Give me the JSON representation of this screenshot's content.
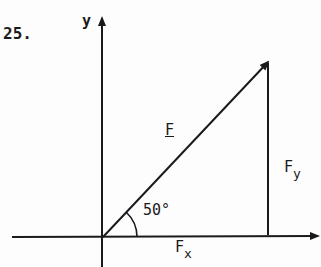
{
  "problem_number": "25.",
  "axes": {
    "x_label": "",
    "y_label": "y"
  },
  "vector": {
    "label": "F",
    "angle_label": "50°",
    "angle_deg": 50
  },
  "components": {
    "fx": {
      "main": "F",
      "sub": "x"
    },
    "fy": {
      "main": "F",
      "sub": "y"
    }
  },
  "colors": {
    "ink": "#1a1a1a",
    "background": "#fdfdfd"
  }
}
